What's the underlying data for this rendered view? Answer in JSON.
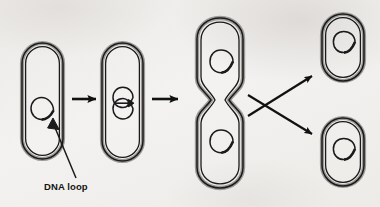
{
  "figure": {
    "kind": "biology-diagram",
    "background_color": "#f1f0ee",
    "ink_color": "#1a1a1a",
    "membrane_fill_color": "#9c9a97"
  },
  "annotations": {
    "dna_loop_label": "DNA loop"
  },
  "cells": [
    {
      "id": "cell-1",
      "name": "parent-cell",
      "stage": "single DNA loop",
      "loop_count": 1,
      "x": 22,
      "y": 43,
      "width": 41,
      "height": 116
    },
    {
      "id": "cell-2",
      "name": "replicating-cell",
      "stage": "DNA replicated, two loops",
      "loop_count": 2,
      "x": 102,
      "y": 43,
      "width": 41,
      "height": 118
    },
    {
      "id": "cell-3",
      "name": "dividing-cell",
      "stage": "elongated with septum constriction",
      "loop_count": 2,
      "x": 196,
      "y": 18,
      "width": 48,
      "height": 170
    },
    {
      "id": "cell-4",
      "name": "daughter-cell-top",
      "stage": "daughter cell",
      "loop_count": 1,
      "x": 322,
      "y": 14,
      "width": 42,
      "height": 67
    },
    {
      "id": "cell-5",
      "name": "daughter-cell-bottom",
      "stage": "daughter cell",
      "loop_count": 1,
      "x": 322,
      "y": 118,
      "width": 42,
      "height": 68
    }
  ],
  "arrows": [
    {
      "id": "arrow-1",
      "name": "arrow-cell1-to-cell2",
      "type": "horizontal",
      "x1": 72,
      "y1": 99,
      "x2": 96,
      "y2": 99
    },
    {
      "id": "arrow-2",
      "name": "arrow-cell2-to-cell3",
      "type": "horizontal",
      "x1": 152,
      "y1": 99,
      "x2": 178,
      "y2": 99
    },
    {
      "id": "arrow-3",
      "name": "arrow-cell3-to-daughter-top",
      "type": "diagonal-up",
      "x1": 248,
      "y1": 116,
      "x2": 312,
      "y2": 76
    },
    {
      "id": "arrow-4",
      "name": "arrow-cell3-to-daughter-bottom",
      "type": "diagonal-down",
      "x1": 248,
      "y1": 95,
      "x2": 312,
      "y2": 134
    }
  ],
  "leader_line": {
    "name": "dna-loop-leader",
    "x1": 76,
    "y1": 178,
    "x2": 52,
    "y2": 123,
    "label_x": 44,
    "label_y": 190
  }
}
